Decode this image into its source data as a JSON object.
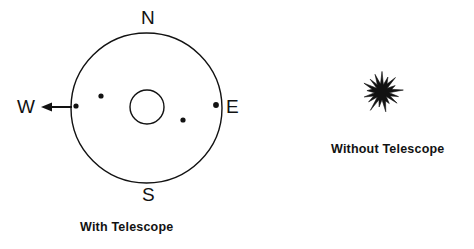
{
  "figure": {
    "title_hidden": "",
    "background_color": "#ffffff",
    "ink_color": "#121212",
    "panels": [
      {
        "id": "with-telescope",
        "caption": "With Telescope",
        "description": "Telescope field of view circle with compass directions and four resolved star points",
        "compass": {
          "north": "N",
          "south": "S",
          "east": "E",
          "west": "W"
        },
        "field_circle": {
          "center_x": 146.5,
          "center_y": 108,
          "radius_x": 75.5,
          "radius_y": 75,
          "stroke_width": 1.4
        },
        "inner_circle": {
          "center_x": 147,
          "center_y": 107,
          "radius": 17,
          "stroke_width": 1.4
        },
        "stars": [
          {
            "label": "star-west-edge",
            "x": 76,
            "y": 106,
            "r": 2.6
          },
          {
            "label": "star-northwest",
            "x": 101,
            "y": 96,
            "r": 2.6
          },
          {
            "label": "star-southeast",
            "x": 183,
            "y": 120,
            "r": 2.6
          },
          {
            "label": "star-east-edge",
            "x": 216,
            "y": 105,
            "r": 2.9
          }
        ],
        "west_arrow": {
          "from_x": 72,
          "from_y": 107,
          "to_x": 41,
          "to_y": 107,
          "stroke_width": 2
        }
      },
      {
        "id": "without-telescope",
        "caption": "Without Telescope",
        "description": "Single unresolved starburst point of light",
        "starburst": {
          "center_x": 382,
          "center_y": 92,
          "outer_radius": 21,
          "inner_radius": 7,
          "points": 17
        }
      }
    ]
  }
}
